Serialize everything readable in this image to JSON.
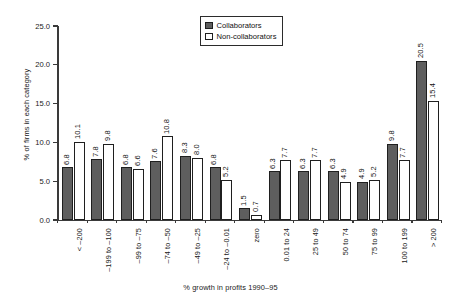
{
  "chart_data": {
    "type": "bar",
    "title": "",
    "xlabel": "% growth in profits 1990–95",
    "ylabel": "% of firms in each category",
    "ylim": [
      0,
      25
    ],
    "yticks": [
      "0.0",
      "5.0",
      "10.0",
      "15.0",
      "20.0",
      "25.0"
    ],
    "ytick_values": [
      0,
      5,
      10,
      15,
      20,
      25
    ],
    "grid": false,
    "legend_position": "top-center",
    "categories": [
      "< –200",
      "–199 to –100",
      "–99 to –75",
      "–74 to –50",
      "–49 to –25",
      "–24 to –0.01",
      "zero",
      "0.01 to 24",
      "25 to 49",
      "50 to 74",
      "75 to 99",
      "100 to 199",
      "> 200"
    ],
    "series": [
      {
        "name": "Collaborators",
        "color": "#5e5e5e",
        "values": [
          6.8,
          7.8,
          6.8,
          7.6,
          8.3,
          6.8,
          1.5,
          6.3,
          6.3,
          6.3,
          4.9,
          9.8,
          20.5
        ],
        "labels": [
          "6.8",
          "7.8",
          "6.8",
          "7.6",
          "8.3",
          "6.8",
          "1.5",
          "6.3",
          "6.3",
          "6.3",
          "4.9",
          "9.8",
          "20.5"
        ]
      },
      {
        "name": "Non-collaborators",
        "color": "#ffffff",
        "values": [
          10.1,
          9.8,
          6.6,
          10.8,
          8.0,
          5.2,
          0.7,
          7.7,
          7.7,
          4.9,
          5.2,
          7.7,
          15.4
        ],
        "labels": [
          "10.1",
          "9.8",
          "6.6",
          "10.8",
          "8.0",
          "5.2",
          "0.7",
          "7.7",
          "7.7",
          "4.9",
          "5.2",
          "7.7",
          "15.4"
        ]
      }
    ]
  },
  "legend": {
    "items": [
      {
        "label": "Collaborators",
        "swatch": "collab"
      },
      {
        "label": "Non-collaborators",
        "swatch": "noncollab"
      }
    ]
  }
}
